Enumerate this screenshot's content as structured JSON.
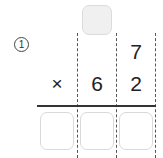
{
  "problem": {
    "number_label": "1",
    "carry_box": {
      "value": "",
      "state": "filled"
    },
    "multiplicand": {
      "digits": [
        "",
        "",
        "7"
      ]
    },
    "multiplier": {
      "operator": "×",
      "digits": [
        "",
        "6",
        "2"
      ]
    },
    "answer_boxes": [
      {
        "value": ""
      },
      {
        "value": ""
      },
      {
        "value": ""
      }
    ]
  },
  "colors": {
    "text": "#222222",
    "dashed_line": "#555555",
    "rule": "#333333",
    "box_border": "#d9d9d9",
    "carry_box_fill": "#f0f0f0"
  }
}
